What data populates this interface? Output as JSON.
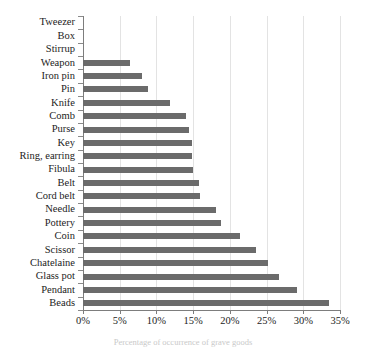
{
  "chart_data": {
    "type": "bar",
    "orientation": "horizontal",
    "title": "",
    "xlabel": "",
    "ylabel": "",
    "xlim": [
      0,
      35
    ],
    "xticks": [
      "0%",
      "5%",
      "10%",
      "15%",
      "20%",
      "25%",
      "30%",
      "35%"
    ],
    "xtick_values": [
      0,
      5,
      10,
      15,
      20,
      25,
      30,
      35
    ],
    "grid": "vertical",
    "legend": "none",
    "bar_color": "#6b6b6b",
    "gridline_color": "#e3e3e3",
    "axis_color": "#7d7d7d",
    "categories": [
      "Tweezer",
      "Box",
      "Stirrup",
      "Weapon",
      "Iron pin",
      "Pin",
      "Knife",
      "Comb",
      "Purse",
      "Key",
      "Ring, earring",
      "Fibula",
      "Belt",
      "Cord belt",
      "Needle",
      "Pottery",
      "Coin",
      "Scissor",
      "Chatelaine",
      "Glass pot",
      "Pendant",
      "Beads"
    ],
    "values": [
      0,
      0,
      0,
      6.4,
      8.0,
      8.8,
      11.9,
      14.0,
      14.4,
      14.8,
      14.8,
      15.0,
      15.8,
      15.9,
      18.1,
      18.8,
      21.4,
      23.6,
      25.2,
      26.7,
      29.2,
      33.5
    ]
  },
  "caption": {
    "text": "Percentage of occurrence of grave goods"
  }
}
